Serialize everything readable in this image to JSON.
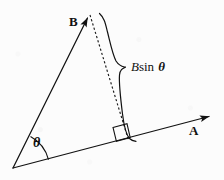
{
  "figure": {
    "title_text": "",
    "background_color": "#fcfcfc",
    "ink_color": "#111111",
    "labels": {
      "vector_b": "B",
      "vector_a": "A",
      "angle": "θ",
      "projection_b_italic": "B",
      "projection_sin": "sin",
      "projection_theta": "θ"
    },
    "geometry": {
      "origin": [
        13,
        168
      ],
      "vector_a_tip": [
        215,
        115
      ],
      "vector_b_tip": [
        90,
        13
      ],
      "foot_of_perpendicular": [
        128,
        140
      ],
      "right_angle_marker": [
        113,
        126
      ],
      "angle_arc_degrees": 52,
      "dashed_line_from": [
        90,
        13
      ],
      "dashed_line_to": [
        128,
        140
      ],
      "brace_top": [
        101,
        14
      ],
      "brace_notch": [
        124,
        67
      ],
      "brace_bottom": [
        136,
        141
      ]
    },
    "elements": [
      "vector-a-arrow",
      "vector-b-arrow",
      "dashed-perpendicular",
      "right-angle-marker",
      "angle-arc",
      "brace"
    ]
  }
}
